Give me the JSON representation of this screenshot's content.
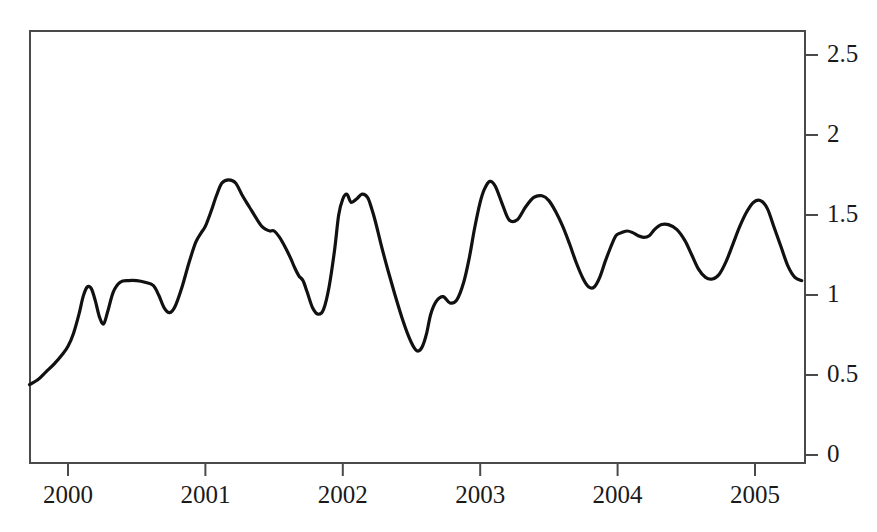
{
  "chart_data": {
    "type": "line",
    "title": "",
    "subtitle": "",
    "xlabel": "",
    "ylabel": "",
    "xlim": [
      1999.72,
      2005.36
    ],
    "ylim": [
      0,
      2.6
    ],
    "grid": false,
    "legend": null,
    "annotations": [],
    "x_ticks": [
      2000,
      2001,
      2002,
      2003,
      2004,
      2005
    ],
    "x_tick_labels": [
      "2000",
      "2001",
      "2002",
      "2003",
      "2004",
      "2005"
    ],
    "y_ticks": [
      0,
      0.5,
      1,
      1.5,
      2,
      2.5
    ],
    "y_tick_labels": [
      "0",
      "0.5",
      "1",
      "1.5",
      "2",
      "2.5"
    ],
    "y_axis_position": "right",
    "series": [
      {
        "name": "series-1",
        "color": "#111111",
        "x": [
          1999.72,
          1999.78,
          1999.84,
          1999.9,
          1999.96,
          2000.0,
          2000.04,
          2000.08,
          2000.11,
          2000.14,
          2000.17,
          2000.2,
          2000.23,
          2000.26,
          2000.29,
          2000.33,
          2000.38,
          2000.44,
          2000.5,
          2000.56,
          2000.62,
          2000.66,
          2000.7,
          2000.74,
          2000.78,
          2000.83,
          2000.88,
          2000.93,
          2000.97,
          2001.0,
          2001.04,
          2001.08,
          2001.12,
          2001.17,
          2001.22,
          2001.27,
          2001.32,
          2001.37,
          2001.41,
          2001.44,
          2001.47,
          2001.5,
          2001.54,
          2001.58,
          2001.62,
          2001.65,
          2001.68,
          2001.71,
          2001.74,
          2001.78,
          2001.82,
          2001.86,
          2001.9,
          2001.94,
          2001.97,
          2002.0,
          2002.03,
          2002.06,
          2002.1,
          2002.14,
          2002.18,
          2002.21,
          2002.24,
          2002.28,
          2002.33,
          2002.38,
          2002.43,
          2002.48,
          2002.52,
          2002.55,
          2002.58,
          2002.61,
          2002.64,
          2002.68,
          2002.73,
          2002.78,
          2002.83,
          2002.88,
          2002.92,
          2002.96,
          2003.0,
          2003.03,
          2003.07,
          2003.11,
          2003.16,
          2003.21,
          2003.27,
          2003.33,
          2003.39,
          2003.45,
          2003.5,
          2003.55,
          2003.6,
          2003.65,
          2003.7,
          2003.75,
          2003.79,
          2003.83,
          2003.87,
          2003.91,
          2003.95,
          2003.98,
          2004.0,
          2004.03,
          2004.07,
          2004.11,
          2004.15,
          2004.19,
          2004.23,
          2004.27,
          2004.32,
          2004.37,
          2004.43,
          2004.49,
          2004.54,
          2004.59,
          2004.64,
          2004.69,
          2004.74,
          2004.79,
          2004.84,
          2004.89,
          2004.94,
          2004.99,
          2005.04,
          2005.09,
          2005.14,
          2005.19,
          2005.24,
          2005.29,
          2005.34
        ],
        "y": [
          0.44,
          0.47,
          0.52,
          0.57,
          0.63,
          0.68,
          0.76,
          0.88,
          0.99,
          1.05,
          1.04,
          0.96,
          0.86,
          0.82,
          0.9,
          1.02,
          1.08,
          1.09,
          1.09,
          1.08,
          1.06,
          1.0,
          0.92,
          0.89,
          0.93,
          1.05,
          1.2,
          1.33,
          1.39,
          1.43,
          1.52,
          1.62,
          1.7,
          1.72,
          1.7,
          1.62,
          1.55,
          1.48,
          1.43,
          1.41,
          1.4,
          1.4,
          1.36,
          1.3,
          1.23,
          1.17,
          1.12,
          1.09,
          1.02,
          0.92,
          0.88,
          0.91,
          1.05,
          1.28,
          1.5,
          1.6,
          1.63,
          1.58,
          1.6,
          1.63,
          1.61,
          1.54,
          1.45,
          1.31,
          1.15,
          1.0,
          0.86,
          0.74,
          0.67,
          0.65,
          0.68,
          0.76,
          0.88,
          0.96,
          0.99,
          0.95,
          0.97,
          1.08,
          1.23,
          1.42,
          1.58,
          1.66,
          1.71,
          1.68,
          1.57,
          1.47,
          1.47,
          1.55,
          1.61,
          1.62,
          1.59,
          1.52,
          1.43,
          1.32,
          1.2,
          1.1,
          1.05,
          1.05,
          1.11,
          1.21,
          1.3,
          1.36,
          1.38,
          1.39,
          1.4,
          1.39,
          1.37,
          1.36,
          1.37,
          1.41,
          1.44,
          1.44,
          1.41,
          1.34,
          1.25,
          1.16,
          1.11,
          1.1,
          1.13,
          1.21,
          1.32,
          1.43,
          1.52,
          1.58,
          1.59,
          1.54,
          1.42,
          1.3,
          1.18,
          1.11,
          1.09
        ]
      }
    ]
  },
  "figure": {
    "background_color": "#ffffff",
    "axis_color": "#4a4a4a",
    "line_color": "#111111"
  }
}
